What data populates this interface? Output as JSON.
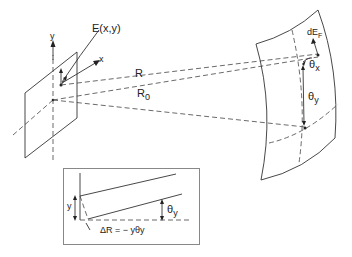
{
  "diagram": {
    "labels": {
      "field": "E(x,y)",
      "y_axis": "y",
      "x_axis": "x",
      "R": "R",
      "R0": "R",
      "R0_sub": "0",
      "dE": "dE",
      "dE_sub": "F",
      "theta_x": "θ",
      "theta_x_sub": "x",
      "theta_y": "θ",
      "theta_y_sub": "y"
    },
    "inset": {
      "y_label": "y",
      "theta_y": "θ",
      "theta_y_sub": "y",
      "delta_R": "ΔR = − yθy"
    },
    "colors": {
      "line": "#333333",
      "background": "#ffffff"
    }
  }
}
